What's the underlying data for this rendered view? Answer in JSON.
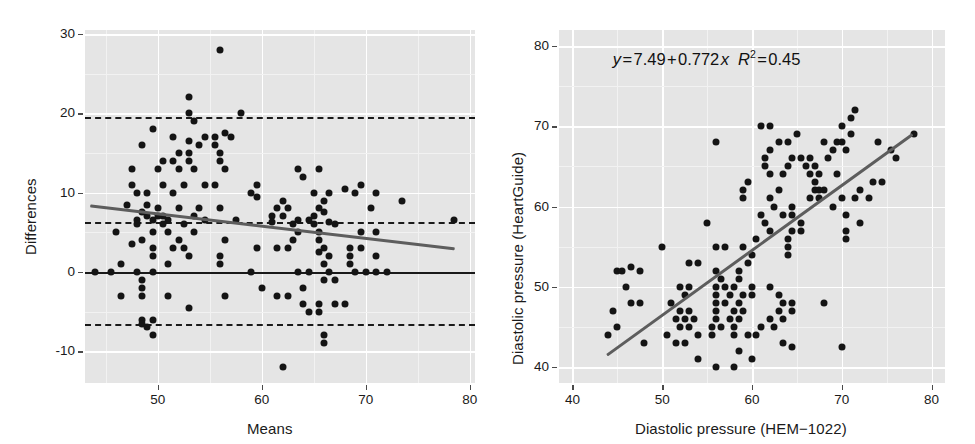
{
  "figure": {
    "background": "#ffffff",
    "panel_background": "#e5e5e5",
    "gridline_color": "#ffffff",
    "point_color": "#141414",
    "trend_color": "#5d5d5d",
    "reference_color": "#1a1a1a"
  },
  "chart_data": [
    {
      "id": "bland-altman",
      "type": "scatter",
      "title": "",
      "xlabel": "Means",
      "ylabel": "Differences",
      "xlim": [
        43.0,
        80.5
      ],
      "ylim": [
        -14.0,
        30.5
      ],
      "xticks": [
        50,
        60,
        70,
        80
      ],
      "yticks": [
        30,
        20,
        10,
        0,
        -10
      ],
      "grid": true,
      "legend": "none",
      "reference_lines": [
        {
          "name": "zero-line",
          "y": 0,
          "style": "solid",
          "color": "#1a1a1a"
        },
        {
          "name": "upper-limit-of-agreement",
          "y": 19.5,
          "style": "dashed",
          "color": "#1a1a1a"
        },
        {
          "name": "bias-line",
          "y": 6.3,
          "style": "dashed",
          "color": "#1a1a1a"
        },
        {
          "name": "lower-limit-of-agreement",
          "y": -6.5,
          "style": "dashed",
          "color": "#1a1a1a"
        }
      ],
      "trend_line": {
        "name": "regression-trend",
        "x0": 43.5,
        "y0": 8.3,
        "x1": 78.5,
        "y1": 2.9,
        "color": "#5d5d5d"
      },
      "points": [
        [
          56.0,
          28.0
        ],
        [
          53.0,
          22.0
        ],
        [
          53.0,
          20.0
        ],
        [
          58.0,
          20.0
        ],
        [
          53.5,
          19.0
        ],
        [
          49.5,
          18.0
        ],
        [
          51.5,
          17.0
        ],
        [
          54.5,
          17.0
        ],
        [
          55.5,
          17.0
        ],
        [
          56.5,
          17.5
        ],
        [
          57.0,
          17.0
        ],
        [
          48.5,
          16.0
        ],
        [
          53.0,
          16.5
        ],
        [
          54.0,
          16.0
        ],
        [
          55.5,
          16.0
        ],
        [
          52.0,
          15.0
        ],
        [
          53.0,
          15.0
        ],
        [
          56.0,
          15.0
        ],
        [
          50.5,
          14.0
        ],
        [
          51.5,
          14.0
        ],
        [
          53.0,
          14.0
        ],
        [
          56.0,
          14.0
        ],
        [
          47.5,
          13.0
        ],
        [
          50.0,
          13.0
        ],
        [
          52.0,
          13.0
        ],
        [
          53.5,
          13.0
        ],
        [
          56.5,
          13.0
        ],
        [
          63.5,
          13.0
        ],
        [
          65.5,
          13.0
        ],
        [
          64.0,
          12.0
        ],
        [
          47.5,
          11.0
        ],
        [
          50.5,
          11.0
        ],
        [
          52.5,
          11.0
        ],
        [
          54.5,
          11.0
        ],
        [
          55.5,
          11.0
        ],
        [
          59.5,
          11.0
        ],
        [
          69.5,
          11.0
        ],
        [
          48.0,
          10.0
        ],
        [
          49.0,
          10.0
        ],
        [
          51.5,
          10.0
        ],
        [
          59.0,
          10.0
        ],
        [
          65.0,
          10.0
        ],
        [
          66.5,
          10.0
        ],
        [
          68.0,
          10.5
        ],
        [
          69.0,
          10.0
        ],
        [
          71.0,
          10.0
        ],
        [
          59.5,
          9.5
        ],
        [
          62.0,
          9.0
        ],
        [
          66.0,
          9.0
        ],
        [
          73.5,
          9.0
        ],
        [
          47.0,
          8.5
        ],
        [
          49.0,
          8.5
        ],
        [
          50.0,
          8.0
        ],
        [
          52.0,
          8.0
        ],
        [
          54.0,
          8.0
        ],
        [
          56.0,
          8.0
        ],
        [
          61.5,
          8.0
        ],
        [
          62.5,
          8.0
        ],
        [
          65.5,
          8.0
        ],
        [
          70.5,
          8.0
        ],
        [
          48.5,
          7.5
        ],
        [
          49.0,
          7.0
        ],
        [
          50.0,
          7.0
        ],
        [
          50.5,
          7.0
        ],
        [
          53.5,
          7.0
        ],
        [
          61.0,
          7.0
        ],
        [
          62.0,
          7.0
        ],
        [
          65.0,
          7.0
        ],
        [
          66.0,
          7.5
        ],
        [
          48.0,
          6.5
        ],
        [
          49.5,
          6.5
        ],
        [
          51.0,
          6.5
        ],
        [
          54.5,
          6.5
        ],
        [
          57.5,
          6.5
        ],
        [
          61.0,
          6.3
        ],
        [
          63.5,
          6.5
        ],
        [
          64.5,
          6.5
        ],
        [
          66.5,
          6.3
        ],
        [
          78.5,
          6.5
        ],
        [
          48.0,
          6.0
        ],
        [
          50.5,
          6.0
        ],
        [
          52.5,
          6.0
        ],
        [
          63.0,
          6.0
        ],
        [
          65.0,
          6.0
        ],
        [
          67.0,
          6.0
        ],
        [
          46.0,
          5.0
        ],
        [
          49.5,
          5.0
        ],
        [
          51.0,
          5.0
        ],
        [
          53.5,
          5.0
        ],
        [
          63.5,
          5.0
        ],
        [
          65.5,
          5.0
        ],
        [
          69.5,
          5.0
        ],
        [
          71.0,
          5.0
        ],
        [
          48.5,
          4.0
        ],
        [
          52.0,
          4.0
        ],
        [
          56.5,
          4.0
        ],
        [
          63.0,
          4.0
        ],
        [
          65.5,
          4.0
        ],
        [
          47.5,
          3.5
        ],
        [
          49.5,
          3.0
        ],
        [
          51.5,
          3.0
        ],
        [
          52.5,
          3.0
        ],
        [
          59.5,
          3.0
        ],
        [
          61.5,
          3.0
        ],
        [
          62.5,
          3.0
        ],
        [
          66.0,
          3.0
        ],
        [
          68.5,
          3.0
        ],
        [
          69.5,
          3.0
        ],
        [
          65.5,
          2.5
        ],
        [
          49.5,
          2.0
        ],
        [
          53.0,
          2.0
        ],
        [
          56.0,
          2.0
        ],
        [
          66.5,
          2.0
        ],
        [
          68.5,
          2.0
        ],
        [
          71.0,
          2.0
        ],
        [
          46.5,
          1.0
        ],
        [
          51.0,
          1.0
        ],
        [
          56.0,
          1.0
        ],
        [
          66.0,
          1.0
        ],
        [
          68.5,
          1.0
        ],
        [
          44.0,
          0.0
        ],
        [
          45.5,
          0.0
        ],
        [
          48.0,
          0.0
        ],
        [
          49.5,
          0.0
        ],
        [
          59.0,
          0.0
        ],
        [
          63.5,
          0.0
        ],
        [
          64.5,
          0.0
        ],
        [
          66.5,
          0.0
        ],
        [
          69.0,
          0.0
        ],
        [
          70.0,
          0.0
        ],
        [
          71.0,
          0.0
        ],
        [
          72.0,
          0.0
        ],
        [
          48.5,
          -1.0
        ],
        [
          66.0,
          -1.0
        ],
        [
          67.0,
          -1.0
        ],
        [
          48.5,
          -2.0
        ],
        [
          60.0,
          -2.0
        ],
        [
          64.0,
          -2.0
        ],
        [
          46.5,
          -3.0
        ],
        [
          48.5,
          -3.0
        ],
        [
          51.0,
          -3.0
        ],
        [
          56.5,
          -3.0
        ],
        [
          61.5,
          -3.0
        ],
        [
          62.5,
          -3.0
        ],
        [
          64.0,
          -4.0
        ],
        [
          65.5,
          -4.0
        ],
        [
          67.0,
          -4.0
        ],
        [
          68.0,
          -4.0
        ],
        [
          53.0,
          -4.5
        ],
        [
          64.5,
          -5.0
        ],
        [
          65.5,
          -5.0
        ],
        [
          48.5,
          -6.0
        ],
        [
          49.5,
          -6.0
        ],
        [
          48.5,
          -6.5
        ],
        [
          49.0,
          -7.0
        ],
        [
          49.5,
          -8.0
        ],
        [
          66.0,
          -8.0
        ],
        [
          66.0,
          -9.0
        ],
        [
          62.0,
          -12.0
        ]
      ]
    },
    {
      "id": "scatter-regression",
      "type": "scatter",
      "title": "",
      "xlabel": "Diastolic pressure (HEM−1022)",
      "ylabel": "Diastolic pressure (HeartGuide)",
      "xlim": [
        38.5,
        81.5
      ],
      "ylim": [
        38.0,
        82.0
      ],
      "xticks": [
        40,
        50,
        60,
        70,
        80
      ],
      "yticks": [
        80,
        70,
        60,
        50,
        40
      ],
      "grid": true,
      "legend": "none",
      "annotation": {
        "name": "regression-equation",
        "text": "y = 7.49 + 0.772 x   R² = 0.45",
        "intercept": 7.49,
        "slope": 0.772,
        "r_squared": 0.45,
        "x": 44.5,
        "y": 78.5
      },
      "trend_line": {
        "name": "regression-line",
        "x0": 44.0,
        "y0": 41.5,
        "x1": 78.0,
        "y1": 69.0,
        "color": "#5d5d5d"
      },
      "points": [
        [
          71.5,
          72.0
        ],
        [
          71.0,
          71.0
        ],
        [
          70.0,
          70.0
        ],
        [
          61.0,
          70.0
        ],
        [
          62.0,
          70.0
        ],
        [
          78.0,
          69.0
        ],
        [
          65.0,
          69.0
        ],
        [
          71.0,
          69.0
        ],
        [
          56.0,
          68.0
        ],
        [
          63.0,
          68.0
        ],
        [
          64.0,
          68.0
        ],
        [
          68.0,
          68.0
        ],
        [
          69.5,
          68.0
        ],
        [
          70.0,
          68.0
        ],
        [
          74.0,
          68.0
        ],
        [
          62.0,
          67.0
        ],
        [
          69.0,
          67.0
        ],
        [
          70.5,
          67.0
        ],
        [
          75.5,
          67.0
        ],
        [
          61.5,
          66.0
        ],
        [
          64.5,
          66.0
        ],
        [
          65.5,
          66.0
        ],
        [
          66.5,
          66.0
        ],
        [
          68.5,
          66.0
        ],
        [
          76.0,
          66.0
        ],
        [
          61.5,
          65.0
        ],
        [
          64.0,
          65.0
        ],
        [
          66.0,
          65.0
        ],
        [
          67.0,
          65.0
        ],
        [
          62.0,
          64.0
        ],
        [
          63.5,
          64.0
        ],
        [
          66.5,
          64.0
        ],
        [
          67.5,
          64.0
        ],
        [
          69.5,
          64.0
        ],
        [
          59.5,
          63.0
        ],
        [
          67.0,
          63.0
        ],
        [
          73.5,
          63.0
        ],
        [
          74.5,
          63.0
        ],
        [
          59.0,
          62.0
        ],
        [
          63.0,
          62.0
        ],
        [
          67.0,
          62.0
        ],
        [
          67.5,
          62.0
        ],
        [
          68.0,
          62.0
        ],
        [
          72.0,
          62.0
        ],
        [
          59.0,
          61.0
        ],
        [
          62.0,
          61.0
        ],
        [
          66.5,
          61.0
        ],
        [
          67.5,
          61.0
        ],
        [
          70.0,
          61.0
        ],
        [
          71.5,
          61.0
        ],
        [
          73.0,
          61.0
        ],
        [
          62.5,
          60.0
        ],
        [
          64.5,
          60.0
        ],
        [
          69.0,
          60.0
        ],
        [
          61.0,
          59.0
        ],
        [
          63.5,
          59.0
        ],
        [
          64.5,
          59.0
        ],
        [
          70.5,
          59.0
        ],
        [
          55.0,
          58.0
        ],
        [
          61.5,
          58.0
        ],
        [
          65.5,
          58.0
        ],
        [
          72.0,
          58.0
        ],
        [
          62.0,
          57.0
        ],
        [
          64.5,
          57.0
        ],
        [
          65.5,
          57.0
        ],
        [
          70.5,
          57.0
        ],
        [
          60.5,
          56.0
        ],
        [
          64.0,
          56.0
        ],
        [
          70.5,
          56.0
        ],
        [
          50.0,
          55.0
        ],
        [
          56.0,
          55.0
        ],
        [
          57.0,
          55.0
        ],
        [
          59.0,
          55.0
        ],
        [
          64.0,
          55.0
        ],
        [
          60.0,
          54.0
        ],
        [
          64.0,
          54.0
        ],
        [
          53.0,
          53.0
        ],
        [
          54.0,
          53.0
        ],
        [
          59.5,
          53.0
        ],
        [
          45.0,
          52.0
        ],
        [
          45.5,
          52.0
        ],
        [
          47.5,
          52.0
        ],
        [
          56.0,
          52.0
        ],
        [
          58.5,
          52.0
        ],
        [
          46.5,
          52.5
        ],
        [
          56.5,
          51.0
        ],
        [
          58.5,
          51.0
        ],
        [
          46.0,
          50.0
        ],
        [
          52.0,
          50.0
        ],
        [
          53.0,
          50.0
        ],
        [
          56.0,
          50.0
        ],
        [
          57.0,
          50.0
        ],
        [
          58.0,
          50.0
        ],
        [
          60.0,
          50.0
        ],
        [
          62.0,
          50.0
        ],
        [
          63.0,
          49.0
        ],
        [
          56.0,
          49.0
        ],
        [
          57.5,
          49.0
        ],
        [
          59.0,
          49.0
        ],
        [
          60.0,
          49.0
        ],
        [
          52.5,
          49.0
        ],
        [
          68.0,
          48.0
        ],
        [
          46.5,
          48.0
        ],
        [
          47.5,
          48.0
        ],
        [
          51.0,
          48.0
        ],
        [
          56.0,
          48.0
        ],
        [
          57.0,
          48.0
        ],
        [
          58.5,
          48.0
        ],
        [
          63.5,
          48.0
        ],
        [
          64.5,
          48.0
        ],
        [
          44.5,
          47.0
        ],
        [
          52.0,
          47.0
        ],
        [
          53.0,
          47.0
        ],
        [
          56.0,
          47.0
        ],
        [
          58.0,
          47.0
        ],
        [
          59.0,
          47.0
        ],
        [
          63.0,
          47.0
        ],
        [
          64.5,
          47.0
        ],
        [
          51.5,
          46.0
        ],
        [
          52.5,
          46.0
        ],
        [
          53.5,
          46.0
        ],
        [
          56.0,
          46.0
        ],
        [
          57.5,
          46.0
        ],
        [
          58.5,
          46.0
        ],
        [
          62.0,
          46.0
        ],
        [
          63.5,
          46.0
        ],
        [
          45.0,
          45.0
        ],
        [
          52.0,
          45.0
        ],
        [
          53.0,
          45.0
        ],
        [
          55.5,
          45.0
        ],
        [
          56.5,
          45.0
        ],
        [
          58.0,
          45.0
        ],
        [
          61.0,
          45.0
        ],
        [
          62.5,
          45.0
        ],
        [
          44.0,
          44.0
        ],
        [
          50.5,
          44.0
        ],
        [
          54.0,
          44.0
        ],
        [
          55.5,
          44.0
        ],
        [
          58.0,
          44.0
        ],
        [
          59.5,
          44.0
        ],
        [
          60.5,
          44.0
        ],
        [
          48.0,
          43.0
        ],
        [
          51.5,
          43.0
        ],
        [
          52.5,
          43.0
        ],
        [
          63.5,
          43.0
        ],
        [
          64.5,
          42.5
        ],
        [
          70.0,
          42.5
        ],
        [
          58.5,
          42.0
        ],
        [
          54.0,
          41.0
        ],
        [
          60.0,
          41.0
        ],
        [
          56.0,
          40.0
        ],
        [
          58.0,
          40.0
        ]
      ]
    }
  ]
}
